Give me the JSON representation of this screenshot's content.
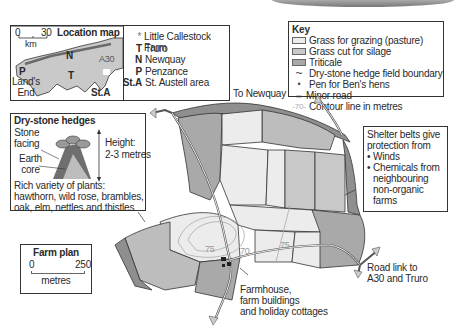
{
  "location_map": {
    "title": "Location map",
    "scale_start": "0",
    "scale_end": "30",
    "scale_unit": "km",
    "map_labels": {
      "N": "N",
      "A30": "A30",
      "P": "P",
      "T": "T",
      "StA": "St.A",
      "lands_end": "Land's\nEnd"
    },
    "legend": [
      {
        "symbol": "*",
        "label": "Little Callestock Farm"
      },
      {
        "symbol": "T",
        "label": "Truro"
      },
      {
        "symbol": "N",
        "label": "Newquay"
      },
      {
        "symbol": "P",
        "label": "Penzance"
      },
      {
        "symbol": "St.A",
        "label": "St. Austell area"
      }
    ]
  },
  "key": {
    "title": "Key",
    "items": [
      {
        "type": "swatch",
        "color": "#ececec",
        "label": "Grass for grazing (pasture)"
      },
      {
        "type": "swatch",
        "color": "#c8c8c8",
        "label": "Grass cut for silage"
      },
      {
        "type": "swatch",
        "color": "#a9a9a9",
        "label": "Triticale"
      },
      {
        "type": "line",
        "symbol": "~",
        "label": "Dry-stone hedge field boundary"
      },
      {
        "type": "dot",
        "symbol": "•",
        "label": "Pen for Ben's hens"
      },
      {
        "type": "road",
        "symbol": "⇔",
        "label": "Minor road"
      },
      {
        "type": "contour",
        "symbol": "-70-",
        "label": "Contour line in metres"
      }
    ]
  },
  "hedges_box": {
    "title": "Dry-stone hedges",
    "stone_facing": "Stone\nfacing",
    "earth_core": "Earth\ncore",
    "height_label": "Height:",
    "height_value": "2-3 metres",
    "plants": "Rich variety of plants: hawthorn, wild rose, brambles, oak, elm, nettles and thistles"
  },
  "shelter_box": {
    "intro": "Shelter belts give protection from",
    "bullets": [
      "Winds",
      "Chemicals from neighbouring non-organic farms"
    ]
  },
  "farm_plan": {
    "title": "Farm plan",
    "scale_start": "0",
    "scale_end": "250",
    "scale_unit": "metres"
  },
  "annotations": {
    "to_newquay": "To Newquay",
    "road_link": "Road link to\nA30 and Truro",
    "farmhouse": "Farmhouse,\nfarm buildings\nand holiday cottages"
  },
  "contours": [
    {
      "value": "75",
      "x": 250,
      "y": 248
    },
    {
      "value": "70",
      "x": 270,
      "y": 248
    },
    {
      "value": "75",
      "x": 284,
      "y": 242
    }
  ],
  "colors": {
    "pasture": "#ececec",
    "silage": "#c8c8c8",
    "triticale": "#a9a9a9",
    "hedge_dark": "#8a8a8a",
    "outline": "#3a3a3a"
  }
}
